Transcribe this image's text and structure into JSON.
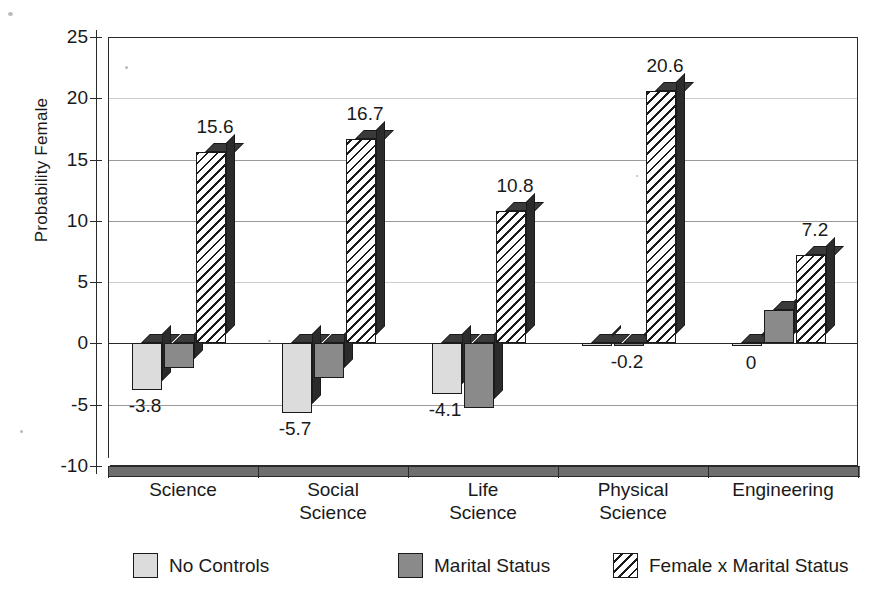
{
  "chart_data": {
    "type": "bar",
    "title": "",
    "subtitle": "",
    "xlabel": "",
    "ylabel": "Probability Female",
    "ylim": [
      -10,
      25
    ],
    "ytick_step": 5,
    "yticks": [
      "25",
      "20",
      "15",
      "10",
      "5",
      "0",
      "-5",
      "-10"
    ],
    "grid": true,
    "legend_position": "bottom",
    "categories": [
      "Science",
      "Social Science",
      "Life Science",
      "Physical Science",
      "Engineering"
    ],
    "category_lines": [
      [
        "Science"
      ],
      [
        "Social",
        "Science"
      ],
      [
        "Life",
        "Science"
      ],
      [
        "Physical",
        "Science"
      ],
      [
        "Engineering"
      ]
    ],
    "series": [
      {
        "name": "No Controls",
        "fill": "light-gray",
        "color": "#dcdcdc",
        "values": [
          -3.8,
          -5.7,
          -4.1,
          0.0,
          0.0
        ],
        "labels": [
          "-3.8",
          "-5.7",
          "-4.1",
          "",
          "0"
        ]
      },
      {
        "name": "Marital Status",
        "fill": "dark-gray",
        "color": "#8a8a8a",
        "values": [
          -2.0,
          -2.8,
          -5.3,
          -0.2,
          2.7
        ],
        "labels": [
          "",
          "",
          "",
          "-0.2",
          ""
        ]
      },
      {
        "name": "Female x Marital Status",
        "fill": "diagonal-hatch",
        "color": "#ffffff",
        "values": [
          15.6,
          16.7,
          10.8,
          20.6,
          7.2
        ],
        "labels": [
          "15.6",
          "16.7",
          "10.8",
          "20.6",
          "7.2"
        ]
      }
    ]
  },
  "axis": {
    "y_title": "Probability Female",
    "ticks": [
      {
        "value": 25,
        "label": "25"
      },
      {
        "value": 20,
        "label": "20"
      },
      {
        "value": 15,
        "label": "15"
      },
      {
        "value": 10,
        "label": "10"
      },
      {
        "value": 5,
        "label": "5"
      },
      {
        "value": 0,
        "label": "0"
      },
      {
        "value": -5,
        "label": "-5"
      },
      {
        "value": -10,
        "label": "-10"
      }
    ]
  },
  "legend": {
    "items": [
      {
        "label": "No Controls",
        "swatch": "light-gray"
      },
      {
        "label": "Marital Status",
        "swatch": "dark-gray"
      },
      {
        "label": "Female x Marital Status",
        "swatch": "diagonal-hatch"
      }
    ]
  },
  "colors": {
    "series_no_controls": "#dcdcdc",
    "series_marital_status": "#8a8a8a",
    "series_interaction": "#ffffff",
    "bar_side": "#2b2b2b",
    "bar_top": "#3a3a3a",
    "axis": "#2a2a2a",
    "gridline": "#9a9a9a",
    "floor": "#6e6e6e",
    "background": "#ffffff"
  }
}
